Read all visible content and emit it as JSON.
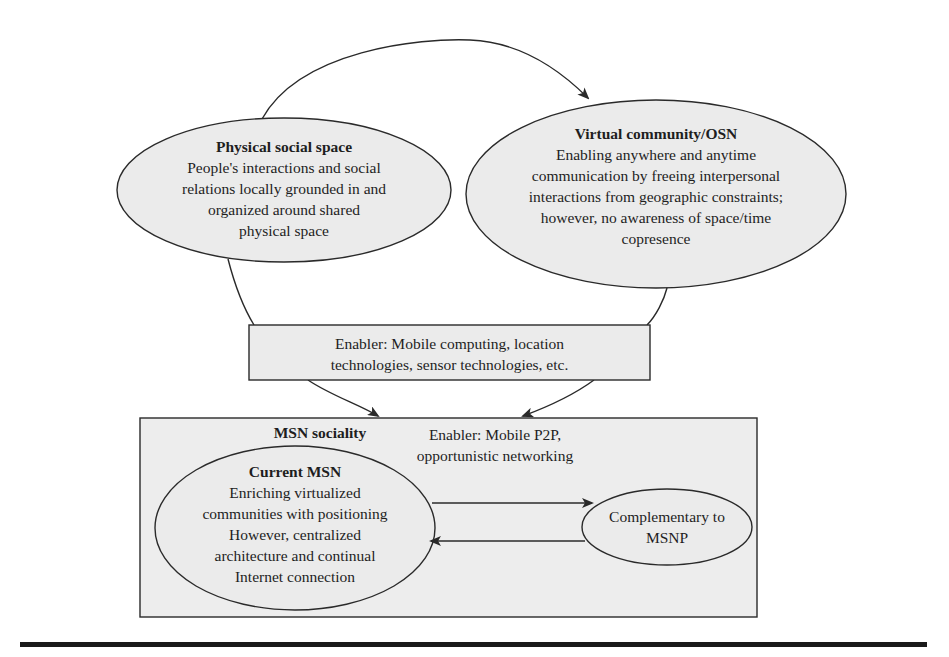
{
  "colors": {
    "shape_fill": "#ebebeb",
    "stroke": "#2a2a2a",
    "background": "#ffffff",
    "rule": "#1a1a1a"
  },
  "nodes": {
    "physical": {
      "title": "Physical social space",
      "lines": [
        "People's interactions and social",
        "relations locally grounded in and",
        "organized around shared",
        "physical space"
      ]
    },
    "virtual": {
      "title": "Virtual community/OSN",
      "lines": [
        "Enabling anywhere and anytime",
        "communication by freeing interpersonal",
        "interactions from geographic constraints;",
        "however, no awareness of space/time",
        "copresence"
      ]
    },
    "enabler_mobile": {
      "lines": [
        "Enabler: Mobile computing, location",
        "technologies, sensor technologies, etc."
      ]
    },
    "msn_sociality": {
      "title": "MSN sociality"
    },
    "enabler_p2p": {
      "lines": [
        "Enabler: Mobile P2P,",
        "opportunistic networking"
      ]
    },
    "current_msn": {
      "title": "Current MSN",
      "lines": [
        "Enriching virtualized",
        "communities with positioning",
        "However, centralized",
        "architecture and continual",
        "Internet connection"
      ]
    },
    "complementary": {
      "lines": [
        "Complementary to",
        "MSNP"
      ]
    }
  },
  "edges": [
    {
      "from": "physical",
      "to": "virtual",
      "type": "curved-arrow"
    },
    {
      "from": "physical",
      "to": "enabler_mobile",
      "type": "line"
    },
    {
      "from": "virtual",
      "to": "enabler_mobile",
      "type": "line"
    },
    {
      "from": "enabler_mobile",
      "to": "msn_sociality",
      "type": "arrow",
      "count": 2
    },
    {
      "from": "current_msn",
      "to": "complementary",
      "type": "arrow"
    },
    {
      "from": "complementary",
      "to": "current_msn",
      "type": "arrow"
    }
  ]
}
